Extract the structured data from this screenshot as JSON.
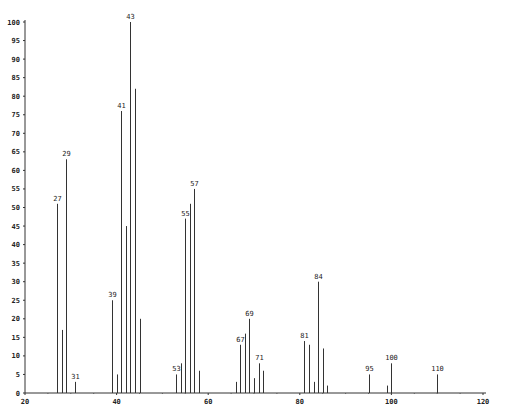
{
  "chart_data": {
    "type": "bar",
    "title": "",
    "xlabel": "",
    "ylabel": "",
    "xlim": [
      20,
      120
    ],
    "ylim": [
      0,
      100
    ],
    "grid": false,
    "legend": null,
    "x_ticks": [
      20,
      40,
      60,
      80,
      100,
      120
    ],
    "x_tick_labels": [
      "20",
      "40",
      "60",
      "80",
      "100",
      "120"
    ],
    "y_ticks": [
      0,
      5,
      10,
      15,
      20,
      25,
      30,
      35,
      40,
      45,
      50,
      55,
      60,
      65,
      70,
      75,
      80,
      85,
      90,
      95,
      100
    ],
    "y_tick_labels": [
      "0",
      "5",
      "10",
      "15",
      "20",
      "25",
      "30",
      "35",
      "40",
      "45",
      "50",
      "55",
      "60",
      "65",
      "70",
      "75",
      "80",
      "85",
      "90",
      "95",
      "100"
    ],
    "series": [
      {
        "name": "intensity",
        "x": [
          27,
          28,
          29,
          31,
          39,
          40,
          41,
          42,
          43,
          44,
          45,
          53,
          54,
          55,
          56,
          57,
          58,
          66,
          67,
          68,
          69,
          70,
          71,
          72,
          81,
          82,
          83,
          84,
          85,
          86,
          95,
          99,
          100,
          110
        ],
        "values": [
          51,
          17,
          63,
          3,
          25,
          5,
          76,
          45,
          100,
          82,
          20,
          5,
          8,
          47,
          51,
          55,
          6,
          3,
          13,
          16,
          20,
          4,
          8,
          6,
          14,
          13,
          3,
          30,
          12,
          2,
          5,
          2,
          8,
          5
        ]
      }
    ],
    "annotations": [
      {
        "x": 27,
        "text": "27"
      },
      {
        "x": 29,
        "text": "29"
      },
      {
        "x": 31,
        "text": "31"
      },
      {
        "x": 39,
        "text": "39"
      },
      {
        "x": 41,
        "text": "41"
      },
      {
        "x": 43,
        "text": "43"
      },
      {
        "x": 53,
        "text": "53"
      },
      {
        "x": 55,
        "text": "55"
      },
      {
        "x": 57,
        "text": "57"
      },
      {
        "x": 67,
        "text": "67"
      },
      {
        "x": 69,
        "text": "69"
      },
      {
        "x": 71,
        "text": "71"
      },
      {
        "x": 81,
        "text": "81"
      },
      {
        "x": 84,
        "text": "84"
      },
      {
        "x": 95,
        "text": "95"
      },
      {
        "x": 100,
        "text": "100"
      },
      {
        "x": 110,
        "text": "110"
      }
    ]
  },
  "style": {
    "line_color": "#333333",
    "axis_color": "#333333",
    "background": "#ffffff"
  }
}
